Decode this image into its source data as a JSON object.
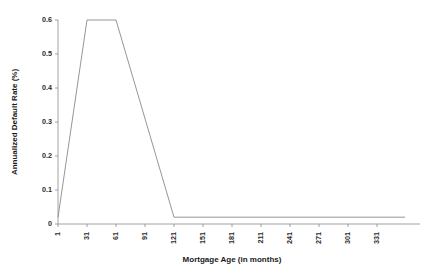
{
  "chart_data": {
    "type": "line",
    "title": "",
    "subtitle": "",
    "xlabel": "Mortgage Age (in months)",
    "ylabel": "Annualized Default Rate (%)",
    "xlim": [
      1,
      360
    ],
    "ylim": [
      0,
      0.6
    ],
    "grid": false,
    "legend": false,
    "legend_position": "none",
    "xtick_labels": [
      "1",
      "31",
      "61",
      "91",
      "121",
      "151",
      "181",
      "211",
      "241",
      "271",
      "301",
      "331"
    ],
    "xtick_values": [
      1,
      31,
      61,
      91,
      121,
      151,
      181,
      211,
      241,
      271,
      301,
      331
    ],
    "xtick_rotation": 90,
    "ytick_labels": [
      "0",
      "0.1",
      "0.2",
      "0.3",
      "0.4",
      "0.5",
      "0.6"
    ],
    "ytick_values": [
      0,
      0.1,
      0.2,
      0.3,
      0.4,
      0.5,
      0.6
    ],
    "series": [
      {
        "name": "Annualized Default Rate",
        "color": "#8a8a8a",
        "x": [
          1,
          31,
          61,
          121,
          360
        ],
        "values": [
          0.02,
          0.6,
          0.6,
          0.02,
          0.02
        ]
      }
    ],
    "annotations": []
  },
  "colors": {
    "line": "#8a8a8a",
    "axis": "#8c8c8c",
    "text": "#1a1a1a",
    "background": "#ffffff"
  }
}
